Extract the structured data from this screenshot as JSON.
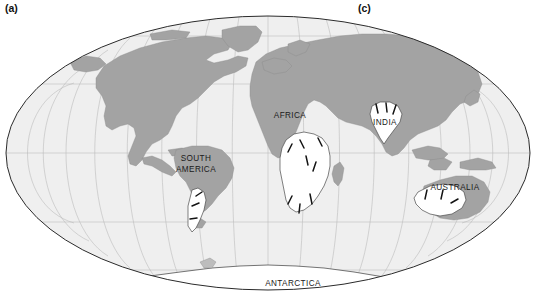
{
  "figure": {
    "type": "world-map-mollweide",
    "caption_labels": [
      {
        "id": "a",
        "text": "(a)"
      },
      {
        "id": "c",
        "text": "(c)"
      }
    ],
    "panel_a_label": "(a)",
    "panel_c_label": "(c)"
  },
  "map": {
    "projection": "Mollweide elliptical world projection",
    "graticule": {
      "longitude_interval_deg": 20,
      "latitude_interval_deg": 30,
      "visible": true,
      "line_color": "#b9b9b9"
    },
    "colors": {
      "ocean": "#efefef",
      "land": "#a3a3a3",
      "glaciated_area": "#ffffff",
      "outline": "#2b2b2b",
      "ice_flow_tick": "#111111",
      "background": "#ffffff",
      "text": "#1a1a1a"
    },
    "ellipse": {
      "center_x": 268,
      "center_y": 153,
      "radius_x": 262,
      "radius_y": 137
    },
    "continent_labels": [
      {
        "name": "AFRICA",
        "text": "AFRICA",
        "x": 290,
        "y": 118
      },
      {
        "name": "INDIA",
        "text": "INDIA",
        "x": 385,
        "y": 125
      },
      {
        "name": "SOUTH AMERICA",
        "line1": "SOUTH",
        "line2": "AMERICA",
        "x": 196,
        "y": 165
      },
      {
        "name": "AUSTRALIA",
        "text": "AUSTRALIA",
        "x": 455,
        "y": 190
      },
      {
        "name": "ANTARCTICA",
        "text": "ANTARCTICA",
        "x": 293,
        "y": 285
      }
    ],
    "glaciated_regions": [
      {
        "name": "southern-africa",
        "label": "AFRICA"
      },
      {
        "name": "india",
        "label": "INDIA"
      },
      {
        "name": "southern-south-america",
        "label": "SOUTH AMERICA"
      },
      {
        "name": "western-australia",
        "label": "AUSTRALIA"
      },
      {
        "name": "antarctica",
        "label": "ANTARCTICA"
      }
    ]
  }
}
